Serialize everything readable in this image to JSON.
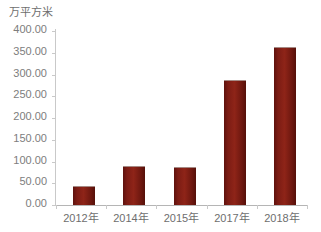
{
  "chart_data": {
    "type": "bar",
    "title": "",
    "subtitle": "",
    "unit_label": "万平方米",
    "xlabel": "",
    "ylabel": "",
    "categories": [
      "2012年",
      "2014年",
      "2015年",
      "2017年",
      "2018年"
    ],
    "values": [
      41.0,
      88.0,
      85.0,
      286.0,
      360.0
    ],
    "series": [
      {
        "name": "万平方米",
        "values": [
          41.0,
          88.0,
          85.0,
          286.0,
          360.0
        ]
      }
    ],
    "ylim": [
      0,
      400
    ],
    "ytick_step": 50,
    "ytick_labels": [
      "400.00",
      "350.00",
      "300.00",
      "250.00",
      "200.00",
      "150.00",
      "100.00",
      "50.00",
      "0.00"
    ],
    "ytick_values": [
      400,
      350,
      300,
      250,
      200,
      150,
      100,
      50,
      0
    ],
    "grid": false,
    "legend": false,
    "legend_position": "none",
    "bar_color": "#7c1c14",
    "axis_color": "#c9c9c9",
    "text_color": "#6e6e6e",
    "background_color": "#ffffff"
  }
}
